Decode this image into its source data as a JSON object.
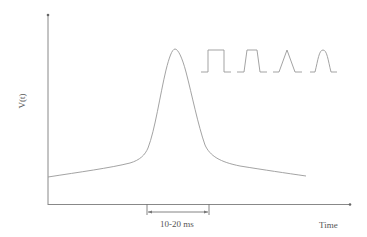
{
  "diagram": {
    "y_axis_label": "V(t)",
    "x_axis_label": "Time",
    "interval_label": "10-20 ms",
    "main_curve": "bell-shaped pulse peaking near center with slow decaying tails",
    "inset_pulses": [
      "rectangular",
      "trapezoidal",
      "triangular",
      "rounded/sinusoidal"
    ],
    "colors": {
      "line": "#888888",
      "axis": "#777777",
      "text": "#555555"
    }
  }
}
